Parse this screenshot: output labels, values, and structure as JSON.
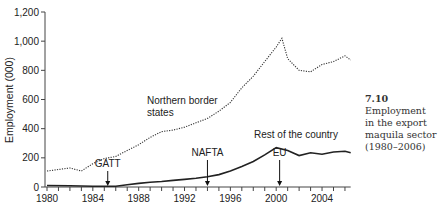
{
  "chart_data": {
    "type": "line",
    "title": "",
    "xlabel": "",
    "ylabel": "Employment (000)",
    "ylim": [
      0,
      1200
    ],
    "xlim": [
      1979.5,
      2006.5
    ],
    "y_ticks": [
      "0",
      "200",
      "400",
      "600",
      "800",
      "1,000",
      "1,200"
    ],
    "y_tick_values": [
      0,
      200,
      400,
      600,
      800,
      1000,
      1200
    ],
    "x_ticks": [
      "1980",
      "1984",
      "1988",
      "1992",
      "1996",
      "2000",
      "2004"
    ],
    "x_tick_values": [
      1980,
      1984,
      1988,
      1992,
      1996,
      2000,
      2004
    ],
    "grid": false,
    "legend": "inline labels",
    "series": [
      {
        "name": "Northern border states",
        "style": "dotted",
        "x": [
          1980,
          1981,
          1982,
          1983,
          1984,
          1985,
          1986,
          1987,
          1988,
          1989,
          1990,
          1991,
          1992,
          1993,
          1994,
          1995,
          1996,
          1997,
          1998,
          1999,
          2000,
          2000.5,
          2001,
          2002,
          2003,
          2004,
          2005,
          2006,
          2006.5
        ],
        "values": [
          110,
          120,
          130,
          110,
          160,
          195,
          210,
          250,
          290,
          340,
          380,
          390,
          410,
          440,
          470,
          520,
          580,
          680,
          760,
          860,
          960,
          1020,
          880,
          800,
          790,
          840,
          860,
          900,
          870
        ]
      },
      {
        "name": "Rest of the country",
        "style": "solid",
        "x": [
          1980,
          1982,
          1984,
          1985,
          1986,
          1987,
          1988,
          1989,
          1990,
          1991,
          1992,
          1993,
          1994,
          1995,
          1996,
          1997,
          1998,
          1999,
          2000,
          2001,
          2002,
          2003,
          2004,
          2005,
          2006,
          2006.5
        ],
        "values": [
          10,
          8,
          5,
          5,
          5,
          15,
          25,
          32,
          38,
          45,
          52,
          60,
          70,
          85,
          110,
          140,
          175,
          220,
          270,
          250,
          215,
          235,
          225,
          240,
          245,
          235
        ]
      }
    ],
    "annotations": [
      {
        "text": "Northern border states",
        "x": 1987.5,
        "y": 520
      },
      {
        "text": "Rest of the country",
        "x": 1998,
        "y": 310
      },
      {
        "text": "GATT",
        "x": 1985.3,
        "y": 0,
        "arrow": true
      },
      {
        "text": "NAFTA",
        "x": 1994,
        "y": 0,
        "arrow": true
      },
      {
        "text": "EU",
        "x": 2000.3,
        "y": 0,
        "arrow": true
      }
    ]
  },
  "labels": {
    "ylabel": "Employment (000)",
    "northern": [
      "Northern border",
      "states"
    ],
    "rest": "Rest of the country",
    "gatt": "GATT",
    "nafta": "NAFTA",
    "eu": "EU"
  },
  "caption": {
    "number": "7.10",
    "text": "Employment in the export maquila sector (1980–2006)"
  }
}
